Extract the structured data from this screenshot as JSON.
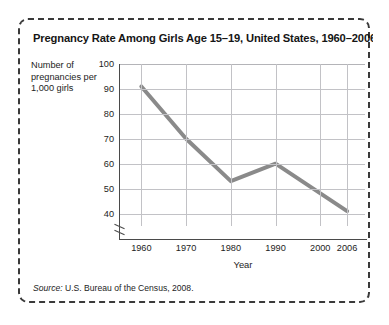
{
  "figure": {
    "title": "Pregnancy Rate Among Girls Age 15–19, United States, 1960–2006",
    "source_prefix": "Source:",
    "source_text": " U.S. Bureau of the Census, 2008.",
    "border_color": "#3a3a3a",
    "background": "#ffffff"
  },
  "chart_data": {
    "type": "line",
    "title": "Pregnancy Rate Among Girls Age 15–19, United States, 1960–2006",
    "xlabel": "Year",
    "ylabel": "Number of pregnancies per 1,000 girls",
    "ylabel_lines": [
      "Number of",
      "pregnancies per",
      "1,000 girls"
    ],
    "x": [
      1960,
      1970,
      1980,
      1990,
      2006
    ],
    "values": [
      91,
      70,
      53,
      60,
      41
    ],
    "series": [
      {
        "name": "Pregnancy rate per 1,000 girls age 15-19",
        "color": "#8a8a8a",
        "values": [
          91,
          70,
          53,
          60,
          41
        ]
      }
    ],
    "xlim": [
      1955,
      2010
    ],
    "ylim": [
      35,
      100
    ],
    "ytick_labels": [
      "100",
      "90",
      "80",
      "70",
      "60",
      "50",
      "40"
    ],
    "ytick_values": [
      100,
      90,
      80,
      70,
      60,
      50,
      40
    ],
    "xtick_labels": [
      "1960",
      "1970",
      "1980",
      "1990",
      "2000",
      "2006"
    ],
    "xtick_values": [
      1960,
      1970,
      1980,
      1990,
      2000,
      2006
    ],
    "grid": true,
    "grid_color": "#c2c2c6",
    "legend": "none",
    "axis_break_y": true,
    "line_width": 4
  }
}
